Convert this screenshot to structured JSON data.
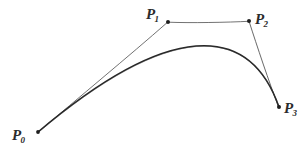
{
  "figure": {
    "kind": "hand-drawn-diagram",
    "background_color": "#ffffff",
    "ink_color": "#2b2b2b",
    "width": 306,
    "height": 156
  },
  "chart_data": {
    "type": "line",
    "xlabel": "",
    "ylabel": "",
    "grid": false,
    "legend": "none",
    "xlim": [
      0,
      306
    ],
    "ylim": [
      156,
      0
    ],
    "control_points": [
      {
        "name": "P0",
        "label_base": "P",
        "label_sub": "0",
        "x": 38,
        "y": 132
      },
      {
        "name": "P1",
        "label_base": "P",
        "label_sub": "1",
        "x": 168,
        "y": 22
      },
      {
        "name": "P2",
        "label_base": "P",
        "label_sub": "2",
        "x": 249,
        "y": 21
      },
      {
        "name": "P3",
        "label_base": "P",
        "label_sub": "3",
        "x": 279,
        "y": 107
      }
    ],
    "control_polygon_segments": [
      {
        "name": "P0-P1",
        "from": "P0",
        "to": "P1"
      },
      {
        "name": "P1-P2",
        "from": "P1",
        "to": "P2"
      },
      {
        "name": "P2-P3",
        "from": "P2",
        "to": "P3"
      }
    ],
    "curve": {
      "name": "cubic-bezier",
      "start": [
        38,
        132
      ],
      "control1": [
        168,
        22
      ],
      "control2": [
        249,
        21
      ],
      "end": [
        279,
        107
      ],
      "apex_approx": [
        205,
        53
      ],
      "path": "M 38 132 C 168 22 249 21 279 107"
    }
  },
  "labels": {
    "p0": {
      "base": "P",
      "sub": "0"
    },
    "p1": {
      "base": "P",
      "sub": "1"
    },
    "p2": {
      "base": "P",
      "sub": "2"
    },
    "p3": {
      "base": "P",
      "sub": "3"
    }
  }
}
